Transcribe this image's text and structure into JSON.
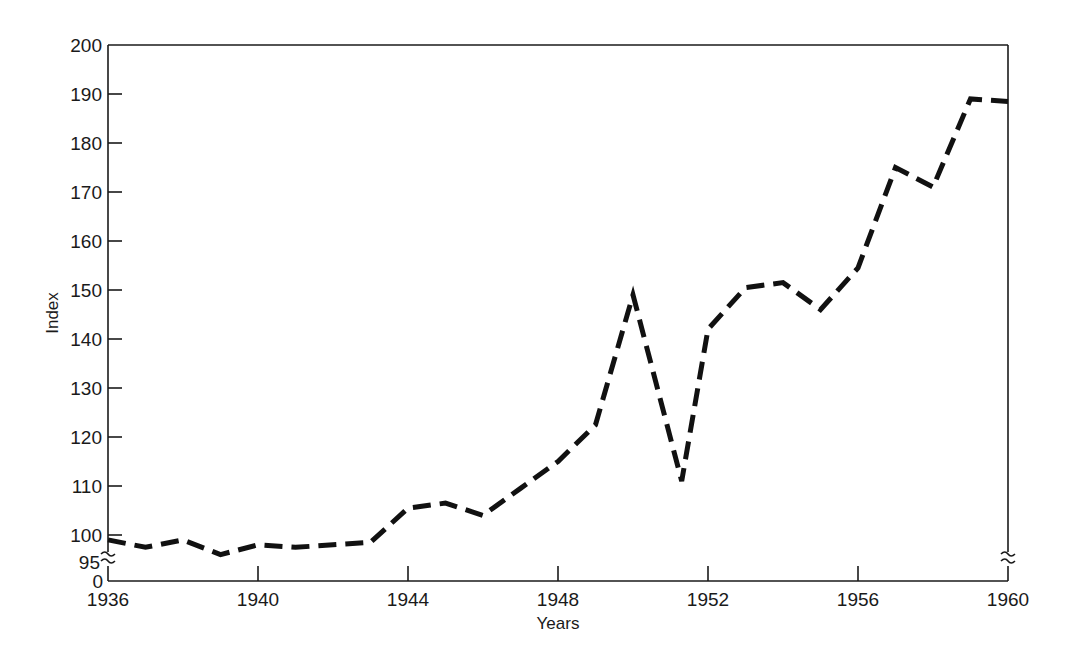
{
  "chart_data": {
    "type": "line",
    "title": "",
    "xlabel": "Years",
    "ylabel": "Index",
    "xlim": [
      1936,
      1960
    ],
    "ylim": [
      95,
      200
    ],
    "y_axis_break": true,
    "y_break_label": "95",
    "y_zero_label": "0",
    "grid": false,
    "legend": null,
    "x_ticks": [
      1936,
      1940,
      1944,
      1948,
      1952,
      1956,
      1960
    ],
    "y_ticks": [
      100,
      110,
      120,
      130,
      140,
      150,
      160,
      170,
      180,
      190,
      200
    ],
    "series": [
      {
        "name": "Index",
        "style": "dashed",
        "x": [
          1936,
          1937,
          1938,
          1939,
          1940,
          1941,
          1942,
          1943,
          1944,
          1945,
          1946,
          1947,
          1948,
          1949,
          1950,
          1951.3,
          1952,
          1953,
          1954,
          1955,
          1956,
          1957,
          1958,
          1959,
          1960
        ],
        "values": [
          99,
          97.5,
          99,
          96,
          98,
          97.5,
          98,
          98.5,
          105.5,
          106.5,
          104,
          109.5,
          115,
          122.5,
          149,
          111,
          142,
          150.5,
          151.5,
          146,
          154.5,
          175,
          171,
          189,
          188.5
        ]
      }
    ]
  }
}
